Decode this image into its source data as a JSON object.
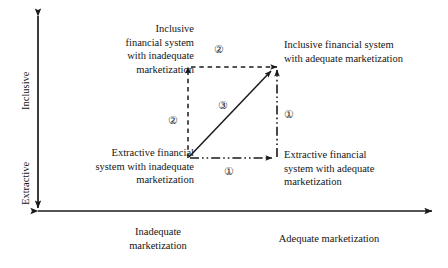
{
  "figure": {
    "type": "quadrant-transition-diagram",
    "background_color": "#ffffff",
    "line_color": "#1a1a1a"
  },
  "axes": {
    "y": {
      "name": "financial-system-inclusiveness-axis",
      "top_label": "Inclusive",
      "bottom_label": "Extractive",
      "double_headed": true
    },
    "x": {
      "name": "marketization-axis",
      "left_label": "Inadequate\nmarketization",
      "right_label": "Adequate marketization",
      "double_headed": true
    }
  },
  "nodes": [
    {
      "id": "top-left",
      "name": "inclusive-inadequate-node",
      "text": "Inclusive\nfinancial system\nwith inadequate\nmarketization"
    },
    {
      "id": "top-right",
      "name": "inclusive-adequate-node",
      "text": "Inclusive financial system\nwith adequate marketization"
    },
    {
      "id": "bottom-left",
      "name": "extractive-inadequate-node",
      "text": "Extractive financial\nsystem with inadequate\nmarketization"
    },
    {
      "id": "bottom-right",
      "name": "extractive-adequate-node",
      "text": "Extractive financial\nsystem with adequate\nmarketization"
    }
  ],
  "paths": [
    {
      "id": "path-1-horizontal",
      "name": "path-one-horizontal-arrow",
      "style": "dash-dot-dot",
      "from": "bottom-left",
      "to": "bottom-right",
      "marker": "①"
    },
    {
      "id": "path-1-vertical",
      "name": "path-one-vertical-arrow",
      "style": "dash-dot-dot",
      "from": "bottom-right",
      "to": "top-right",
      "marker": "①"
    },
    {
      "id": "path-2-vertical",
      "name": "path-two-vertical-arrow",
      "style": "dashed",
      "from": "bottom-left",
      "to": "top-left",
      "marker": "②"
    },
    {
      "id": "path-2-horizontal",
      "name": "path-two-horizontal-arrow",
      "style": "dashed",
      "from": "top-left",
      "to": "top-right",
      "marker": "②"
    },
    {
      "id": "path-3-diagonal",
      "name": "path-three-diagonal-arrow",
      "style": "solid",
      "from": "bottom-left",
      "to": "top-right",
      "marker": "③"
    }
  ],
  "markers": {
    "one": "①",
    "two": "②",
    "three": "③"
  }
}
